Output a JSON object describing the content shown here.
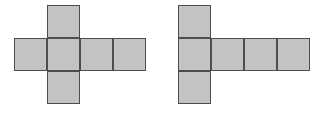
{
  "figure": {
    "canvas": {
      "width": 322,
      "height": 113,
      "background": "#ffffff"
    },
    "style": {
      "cell_fill": "#c3c3c3",
      "cell_stroke": "#4d4d4d",
      "cell_stroke_width": 1.5,
      "cell_size": 33
    },
    "nets": [
      {
        "id": "net-left",
        "name": "left-cube-net",
        "shape": "cross-net",
        "description": "Row of four squares with one square above the second column and one square below the second column",
        "origin_x": 14,
        "origin_y": 5,
        "cell_size": 33,
        "square_count": 6,
        "cells": [
          {
            "name": "top-square",
            "col": 1,
            "row": 0
          },
          {
            "name": "row-square-1",
            "col": 0,
            "row": 1
          },
          {
            "name": "row-square-2",
            "col": 1,
            "row": 1
          },
          {
            "name": "row-square-3",
            "col": 2,
            "row": 1
          },
          {
            "name": "row-square-4",
            "col": 3,
            "row": 1
          },
          {
            "name": "bottom-square",
            "col": 1,
            "row": 2
          }
        ]
      },
      {
        "id": "net-right",
        "name": "right-cube-net",
        "shape": "tee-net",
        "description": "Row of four squares with one square above the first column and one square below the first column",
        "origin_x": 178,
        "origin_y": 5,
        "cell_size": 33,
        "square_count": 6,
        "cells": [
          {
            "name": "top-square",
            "col": 0,
            "row": 0
          },
          {
            "name": "row-square-1",
            "col": 0,
            "row": 1
          },
          {
            "name": "row-square-2",
            "col": 1,
            "row": 1
          },
          {
            "name": "row-square-3",
            "col": 2,
            "row": 1
          },
          {
            "name": "row-square-4",
            "col": 3,
            "row": 1
          },
          {
            "name": "bottom-square",
            "col": 0,
            "row": 2
          }
        ]
      }
    ]
  }
}
